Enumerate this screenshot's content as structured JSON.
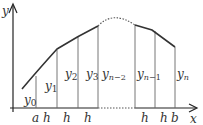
{
  "diagram": {
    "axes": {
      "x_label": "x",
      "y_label": "y"
    },
    "x_ticks": [
      {
        "label": "a",
        "x": 36
      },
      {
        "label": "h",
        "x": 47
      },
      {
        "label": "h",
        "x": 67
      },
      {
        "label": "h",
        "x": 88
      },
      {
        "label": "h",
        "x": 145
      },
      {
        "label": "h",
        "x": 164
      },
      {
        "label": "b",
        "x": 174
      }
    ],
    "ordinates": [
      {
        "label": "y",
        "sub": "0",
        "x": 36,
        "top": 76,
        "lx": 24,
        "ly": 104
      },
      {
        "label": "y",
        "sub": "1",
        "x": 57,
        "top": 50,
        "lx": 45,
        "ly": 90
      },
      {
        "label": "y",
        "sub": "2",
        "x": 78,
        "top": 37,
        "lx": 66,
        "ly": 78
      },
      {
        "label": "y",
        "sub": "3",
        "x": 98,
        "top": 27,
        "lx": 86,
        "ly": 78
      },
      {
        "label": "y",
        "sub": "n−2",
        "x": 135,
        "top": 25,
        "lx": 103,
        "ly": 78
      },
      {
        "label": "y",
        "sub": "n−1",
        "x": 155,
        "top": 31,
        "lx": 137,
        "ly": 78
      },
      {
        "label": "y",
        "sub": "n",
        "x": 175,
        "top": 47,
        "lx": 177,
        "ly": 78
      }
    ]
  }
}
